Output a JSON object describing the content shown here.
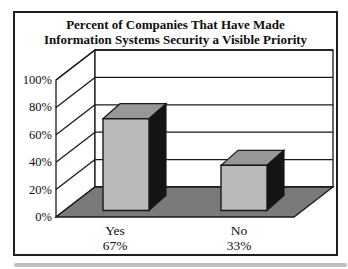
{
  "chart_data": {
    "type": "bar",
    "is_3d": true,
    "title": "Percent of Companies That Have Made Information Systems Security a Visible Priority",
    "title_lines": [
      "Percent of Companies That Have Made",
      "Information Systems Security a Visible Priority"
    ],
    "categories": [
      "Yes",
      "No"
    ],
    "values": [
      67,
      33
    ],
    "category_value_labels": [
      "67%",
      "33%"
    ],
    "y_ticks": [
      0,
      20,
      40,
      60,
      80,
      100
    ],
    "y_tick_labels": [
      "0%",
      "20%",
      "40%",
      "60%",
      "80%",
      "100%"
    ],
    "ylim": [
      0,
      100
    ],
    "xlabel": "",
    "ylabel": "",
    "grid": true,
    "legend": false,
    "colors": {
      "bar_front": "#b9b9b9",
      "bar_top": "#979797",
      "bar_side": "#141414",
      "floor": "#7a7a7a",
      "wall": "#ffffff",
      "gridline": "#1a1a1a",
      "text": "#0e0e0e",
      "frame_border": "#1f1f1f",
      "bottom_strip": "#bfbfbf"
    }
  }
}
